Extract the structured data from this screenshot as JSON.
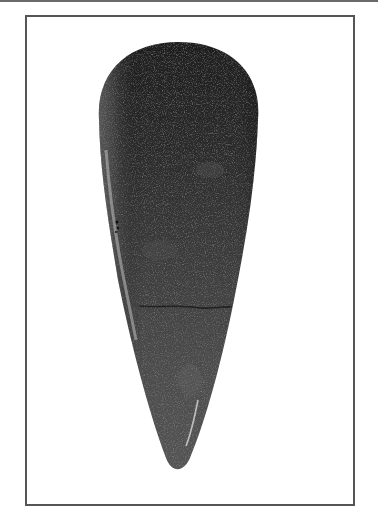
{
  "image": {
    "subject": "polished stone axe head",
    "alt": "Photograph of a dark polished stone axe head, tapering from a rounded butt at the top to a pointed tip at the bottom, framed by a thin gray border"
  },
  "colors": {
    "background": "#ffffff",
    "frame_border": "#555555",
    "top_rule": "#6a6a6a",
    "stone_dark": "#2a2a2a",
    "stone_mid": "#4a4a4a",
    "stone_light": "#8a8a8a"
  }
}
